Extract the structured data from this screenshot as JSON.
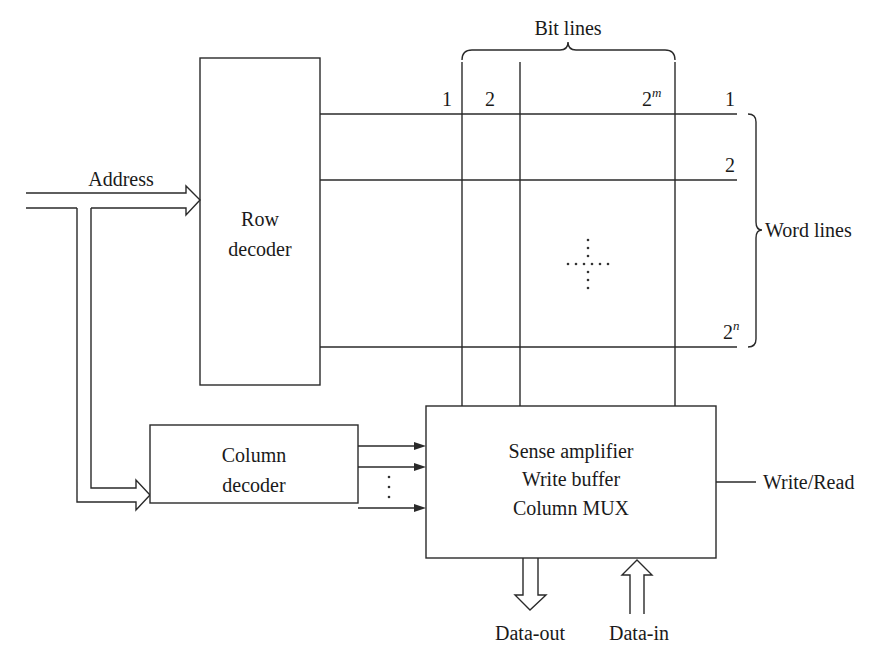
{
  "diagram": {
    "colors": {
      "ink": "#2a2a2a",
      "background": "#ffffff"
    },
    "labels": {
      "bit_lines": "Bit lines",
      "word_lines": "Word lines",
      "address": "Address",
      "write_read": "Write/Read",
      "data_out": "Data-out",
      "data_in": "Data-in"
    },
    "row_decoder": {
      "line1": "Row",
      "line2": "decoder"
    },
    "column_decoder": {
      "line1": "Column",
      "line2": "decoder"
    },
    "sense_block": {
      "line1": "Sense amplifier",
      "line2": "Write buffer",
      "line3": "Column MUX"
    },
    "bit_line_indices": [
      {
        "base": "1",
        "exp": ""
      },
      {
        "base": "2",
        "exp": ""
      },
      {
        "base": "2",
        "exp": "m"
      }
    ],
    "word_line_indices": [
      {
        "base": "1",
        "exp": ""
      },
      {
        "base": "2",
        "exp": ""
      },
      {
        "base": "2",
        "exp": "n"
      }
    ],
    "ellipsis": "⋮"
  }
}
